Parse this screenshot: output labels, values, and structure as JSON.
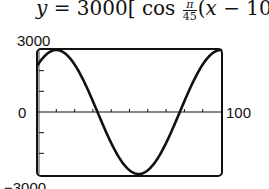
{
  "formula": {
    "lhs": "y",
    "equals": "=",
    "amplitude": "3000",
    "open_bracket": "[",
    "func": "cos",
    "frac_num": "π",
    "frac_den": "45",
    "arg_open": "(",
    "arg_var": "x",
    "arg_op": "−",
    "arg_shift": "10",
    "arg_close": ")",
    "close_bracket": "]"
  },
  "labels": {
    "y_max": "3000",
    "y_min": "−3000",
    "x_min": "0",
    "x_max": "100"
  },
  "colors": {
    "curve": "#111111",
    "frame": "#111111",
    "background": "#ffffff"
  },
  "chart_data": {
    "type": "line",
    "xlabel": "",
    "ylabel": "",
    "xlim": [
      0,
      100
    ],
    "ylim": [
      -3000,
      3000
    ],
    "x_tick_step": 10,
    "y_tick_step": 1000,
    "grid": false,
    "legend": null,
    "series": [
      {
        "name": "y = 3000cos(π/45 (x − 10))",
        "x": [
          0,
          10,
          20,
          32.5,
          40,
          55,
          70,
          77.5,
          90,
          100
        ],
        "values": [
          2298,
          3000,
          2298,
          0,
          -1500,
          -3000,
          -1500,
          0,
          2298,
          3000
        ]
      }
    ],
    "annotations": [
      "3000",
      "−3000",
      "0",
      "100"
    ]
  }
}
